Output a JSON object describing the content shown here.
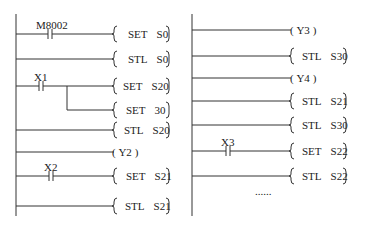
{
  "diagram": {
    "type": "ladder",
    "left": {
      "rungs": [
        {
          "contact": "M8002",
          "instruction": {
            "op": "SET",
            "arg": "S0"
          }
        },
        {
          "contact": null,
          "instruction": {
            "op": "STL",
            "arg": "S0"
          }
        },
        {
          "contact": "X1",
          "instruction": {
            "op": "SET",
            "arg": "S20"
          }
        },
        {
          "contact": null,
          "branch_of": "X1",
          "instruction": {
            "op": "SET",
            "arg": "30"
          }
        },
        {
          "contact": null,
          "instruction": {
            "op": "STL",
            "arg": "S20"
          }
        },
        {
          "contact": null,
          "coil": "Y2"
        },
        {
          "contact": "X2",
          "instruction": {
            "op": "SET",
            "arg": "S21"
          }
        },
        {
          "contact": null,
          "instruction": {
            "op": "STL",
            "arg": "S21"
          }
        }
      ]
    },
    "right": {
      "rungs": [
        {
          "contact": null,
          "coil": "Y3"
        },
        {
          "contact": null,
          "instruction": {
            "op": "STL",
            "arg": "S30"
          }
        },
        {
          "contact": null,
          "coil": "Y4"
        },
        {
          "contact": null,
          "instruction": {
            "op": "STL",
            "arg": "S21"
          }
        },
        {
          "contact": null,
          "instruction": {
            "op": "STL",
            "arg": "S30"
          }
        },
        {
          "contact": "X3",
          "instruction": {
            "op": "SET",
            "arg": "S22"
          }
        },
        {
          "contact": null,
          "instruction": {
            "op": "STL",
            "arg": "S22"
          }
        }
      ],
      "continuation": "......"
    },
    "coil_open": "(",
    "coil_close": ")"
  }
}
